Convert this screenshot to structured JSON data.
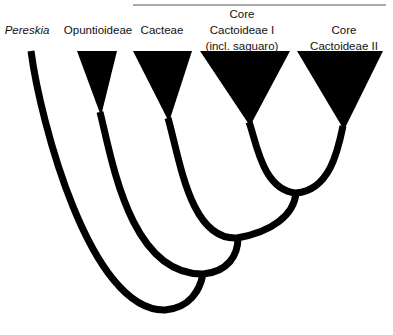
{
  "diagram": {
    "type": "phylogenetic-tree",
    "group_title": "Cactoideae",
    "colors": {
      "ink": "#000000",
      "background": "#ffffff",
      "text": "#111111"
    },
    "taxa": [
      {
        "id": "pereskia",
        "lines": [
          "Pereskia"
        ],
        "italic": true,
        "shape": "stem"
      },
      {
        "id": "opuntioideae",
        "lines": [
          "Opuntioideae"
        ],
        "italic": false,
        "shape": "triangle"
      },
      {
        "id": "cacteae",
        "lines": [
          "Cacteae"
        ],
        "italic": false,
        "shape": "triangle"
      },
      {
        "id": "core-cactoideae-1",
        "lines": [
          "Core",
          "Cactoideae I",
          "(incl. saguaro)"
        ],
        "italic": false,
        "shape": "triangle"
      },
      {
        "id": "core-cactoideae-2",
        "lines": [
          "Core",
          "Cactoideae II"
        ],
        "italic": false,
        "shape": "triangle"
      }
    ],
    "topology": "(Pereskia,(Opuntioideae,(Cacteae,(Core Cactoideae I,Core Cactoideae II))))"
  }
}
